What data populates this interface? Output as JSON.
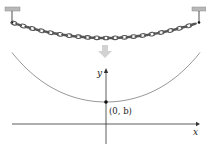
{
  "diagram": {
    "top_panel": {
      "description": "Chain suspended between two ceiling anchors, sagging in the middle",
      "arrow": "down-arrow-icon"
    },
    "graph": {
      "x_axis_label": "x",
      "y_axis_label": "y",
      "point_label": "(0, b)",
      "curve": "catenary"
    },
    "colors": {
      "chain": "#555555",
      "anchor": "#aaaaaa",
      "curve": "#888888",
      "axes": "#222222",
      "arrow": "#cfcfcf"
    }
  }
}
